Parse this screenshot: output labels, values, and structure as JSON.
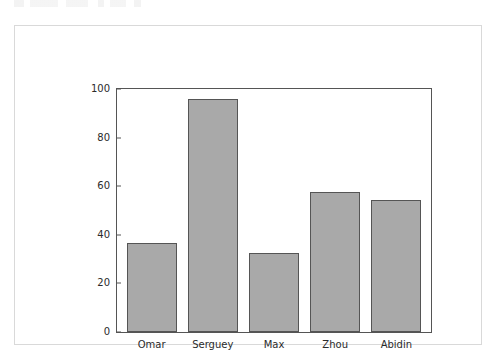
{
  "figure": {
    "background_color": "#ffffff",
    "frame_color": "#d9d9d9",
    "axes_color": "#555555"
  },
  "chart_data": {
    "type": "bar",
    "title": "",
    "xlabel": "",
    "ylabel": "",
    "categories": [
      "Omar",
      "Serguey",
      "Max",
      "Zhou",
      "Abidin"
    ],
    "values": [
      36.5,
      96,
      32.5,
      57.5,
      54.5
    ],
    "ylim": [
      0,
      100
    ],
    "yticks": [
      0,
      20,
      40,
      60,
      80,
      100
    ],
    "ytick_labels": [
      "0",
      "20",
      "40",
      "60",
      "80",
      "100"
    ],
    "grid": false,
    "legend": null,
    "bar_color": "#a9a9a9",
    "bar_edge_color": "#555555"
  }
}
